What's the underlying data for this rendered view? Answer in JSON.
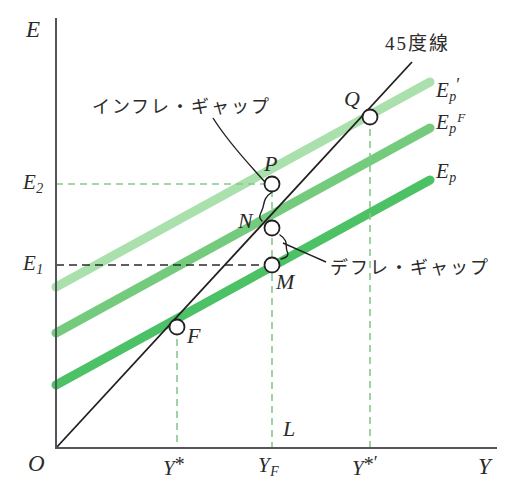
{
  "figure": {
    "type": "economics-45-degree-diagram",
    "axes": {
      "y_axis_label": "E",
      "x_axis_label": "Y",
      "origin_label": "O"
    },
    "y_ticks": [
      {
        "id": "E2",
        "base": "E",
        "sub": "2",
        "y_px": 184,
        "dash_color": "#77c47f"
      },
      {
        "id": "E1",
        "base": "E",
        "sub": "1",
        "y_px": 265,
        "dash_color": "#2b2b2b"
      }
    ],
    "x_ticks": [
      {
        "id": "Ystar",
        "base": "Y",
        "mark": "*",
        "x_px": 177
      },
      {
        "id": "YF",
        "base": "Y",
        "sub": "F",
        "x_px": 272
      },
      {
        "id": "Ystar2",
        "base": "Y",
        "mark": "*",
        "prime": "′",
        "x_px": 370
      }
    ],
    "axis_note": "L",
    "line45_label": "45度線",
    "curves": [
      {
        "id": "Ep_prime",
        "base": "E",
        "sub": "p",
        "prime": "′",
        "color": "#a9e0ab",
        "label_y": 89
      },
      {
        "id": "Ep_F",
        "base": "E",
        "sub": "p",
        "supF": "F",
        "color": "#74cb7d",
        "label_y": 123
      },
      {
        "id": "Ep",
        "base": "E",
        "sub": "p",
        "color": "#4cc166",
        "label_y": 173
      }
    ],
    "points": [
      {
        "id": "Q",
        "label": "Q",
        "x_px": 370,
        "y_px": 117,
        "label_dx": -24,
        "label_dy": -26
      },
      {
        "id": "P",
        "label": "P",
        "x_px": 272,
        "y_px": 184,
        "label_dx": -5,
        "label_dy": -28
      },
      {
        "id": "N",
        "label": "N",
        "x_px": 272,
        "y_px": 228,
        "label_dx": -32,
        "label_dy": -14
      },
      {
        "id": "M",
        "label": "M",
        "x_px": 272,
        "y_px": 265,
        "label_dx": 4,
        "label_dy": 10
      },
      {
        "id": "F",
        "label": "F",
        "x_px": 177,
        "y_px": 327,
        "label_dx": 8,
        "label_dy": 1
      }
    ],
    "annotations": [
      {
        "id": "inflation-gap",
        "text": "インフレ・ギャップ",
        "x_px": 92,
        "y_px": 107
      },
      {
        "id": "deflation-gap",
        "text": "デフレ・ギャップ",
        "x_px": 330,
        "y_px": 268
      }
    ],
    "colors": {
      "axis": "#55545a",
      "line45": "#231f20",
      "green_dash": "#86c98d",
      "black_dash": "#2b2b2b",
      "curve_light": "#a9e0ab",
      "curve_mid": "#74cb7d",
      "curve_dark": "#4cc166",
      "text": "#2b2b2b"
    }
  }
}
